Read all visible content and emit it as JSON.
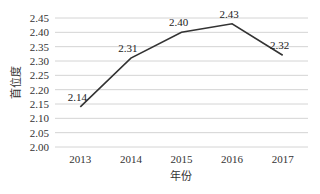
{
  "chart_data": {
    "type": "line",
    "title": "",
    "xlabel": "年份",
    "ylabel": "首位度",
    "categories": [
      "2013",
      "2014",
      "2015",
      "2016",
      "2017"
    ],
    "series": [
      {
        "name": "首位度",
        "values": [
          2.14,
          2.31,
          2.4,
          2.43,
          2.32
        ]
      }
    ],
    "data_labels": [
      "2.14",
      "2.31",
      "2.40",
      "2.43",
      "2.32"
    ],
    "ylim": [
      2.0,
      2.45
    ],
    "yticks": [
      "2.00",
      "2.05",
      "2.10",
      "2.15",
      "2.20",
      "2.25",
      "2.30",
      "2.35",
      "2.40",
      "2.45"
    ],
    "grid": true,
    "legend": "none"
  }
}
